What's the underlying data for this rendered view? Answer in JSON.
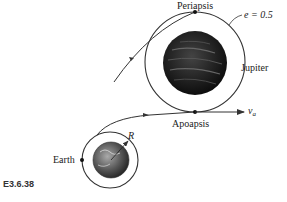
{
  "figure": {
    "id_label": "E3.6.38",
    "labels": {
      "periapsis": "Periapsis",
      "apoapsis": "Apoapsis",
      "jupiter": "Jupiter",
      "earth": "Earth",
      "radius": "R",
      "eccentricity": "e = 0.5",
      "velocity_symbol": "v",
      "velocity_subscript": "a"
    },
    "colors": {
      "line": "#333333",
      "planet_dark": "#1a1a1a",
      "background": "#ffffff"
    }
  }
}
